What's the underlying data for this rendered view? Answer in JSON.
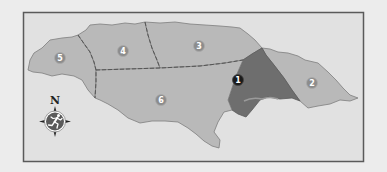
{
  "map": {
    "colors": {
      "page_background": "#ececec",
      "frame_fill": "#e1e1e1",
      "frame_stroke": "#5a5a5a",
      "region_fill": "#b9b9b9",
      "highlight_fill": "#6e6e6e",
      "coast_stroke": "#7d7d7d",
      "boundary_dash": "#555555",
      "marker_fill": "#8c8c8c",
      "marker_highlight_fill": "#1a1a1a",
      "marker_text": "#ffffff",
      "compass_fill": "#5a5a5a"
    },
    "regions": [
      {
        "id": "1",
        "label": "1",
        "highlighted": true
      },
      {
        "id": "2",
        "label": "2",
        "highlighted": false
      },
      {
        "id": "3",
        "label": "3",
        "highlighted": false
      },
      {
        "id": "4",
        "label": "4",
        "highlighted": false
      },
      {
        "id": "5",
        "label": "5",
        "highlighted": false
      },
      {
        "id": "6",
        "label": "6",
        "highlighted": false
      }
    ],
    "compass": {
      "north_label": "N",
      "icon": "running-figure-icon"
    }
  }
}
